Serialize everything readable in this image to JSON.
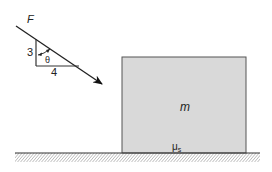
{
  "diagram": {
    "force": {
      "label": "F",
      "triangle": {
        "vertical_leg": "3",
        "horizontal_leg": "4",
        "angle": "θ"
      }
    },
    "block": {
      "mass_label": "m",
      "friction_label": "μ",
      "friction_subscript": "s",
      "fill": "#d9d9d9",
      "stroke": "#555555"
    },
    "ground": {
      "stroke": "#333333"
    }
  }
}
